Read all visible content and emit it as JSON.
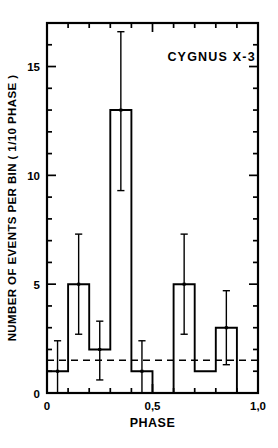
{
  "chart_data": {
    "type": "bar",
    "title": "CYGNUS X-3",
    "title_position": "inside-top-right",
    "xlabel": "PHASE",
    "ylabel": "NUMBER OF EVENTS PER BIN ( 1/10 PHASE )",
    "xlim": [
      0,
      1.0
    ],
    "ylim": [
      0,
      17
    ],
    "grid": false,
    "legend": "none",
    "style": "step-histogram-outline",
    "bin_width": 0.1,
    "categories": [
      "0.0-0.1",
      "0.1-0.2",
      "0.2-0.3",
      "0.3-0.4",
      "0.4-0.5",
      "0.5-0.6",
      "0.6-0.7",
      "0.7-0.8",
      "0.8-0.9",
      "0.9-1.0"
    ],
    "x_bin_edges": [
      0.0,
      0.1,
      0.2,
      0.3,
      0.4,
      0.5,
      0.6,
      0.7,
      0.8,
      0.9,
      1.0
    ],
    "bin_centers": [
      0.05,
      0.15,
      0.25,
      0.35,
      0.45,
      0.55,
      0.65,
      0.75,
      0.85,
      0.95
    ],
    "values": [
      1,
      5,
      2,
      13,
      1,
      0,
      5,
      1,
      3,
      0
    ],
    "errors": [
      {
        "center": 0.05,
        "value": 1,
        "low": 0.0,
        "high": 2.4
      },
      {
        "center": 0.15,
        "value": 5,
        "low": 2.7,
        "high": 7.3
      },
      {
        "center": 0.25,
        "value": 2,
        "low": 0.6,
        "high": 3.3
      },
      {
        "center": 0.35,
        "value": 13,
        "low": 9.3,
        "high": 16.6
      },
      {
        "center": 0.45,
        "value": 1,
        "low": 0.0,
        "high": 2.4
      },
      {
        "center": 0.65,
        "value": 5,
        "low": 2.7,
        "high": 7.3
      },
      {
        "center": 0.85,
        "value": 3,
        "low": 1.3,
        "high": 4.7
      }
    ],
    "reference_line": {
      "y": 1.5,
      "style": "dashed",
      "label": ""
    },
    "y_major_ticks": [
      0,
      5,
      10,
      15
    ],
    "y_major_tick_labels": [
      "0",
      "5",
      "10",
      "15"
    ],
    "y_minor_tick_step": 1,
    "x_major_ticks": [
      0,
      0.5,
      1.0
    ],
    "x_major_tick_labels": [
      "0",
      "0,5",
      "1,0"
    ],
    "x_minor_tick_step": 0.1
  },
  "axis": {
    "y_label": "NUMBER OF EVENTS PER BIN ( 1/10 PHASE )",
    "x_label": "PHASE"
  },
  "annotations": {
    "source_title": "CYGNUS X-3"
  }
}
